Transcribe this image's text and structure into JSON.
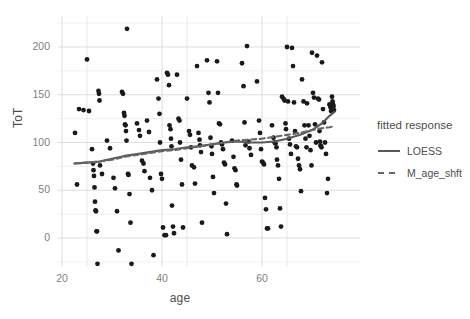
{
  "chart_data": {
    "type": "scatter",
    "title": "",
    "xlabel": "age",
    "ylabel": "ToT",
    "xlim": [
      21,
      76
    ],
    "ylim": [
      -30,
      228
    ],
    "xticks": [
      20,
      40,
      60
    ],
    "yticks": [
      0,
      50,
      100,
      150,
      200
    ],
    "xtick_labels": [
      "20",
      "40",
      "60"
    ],
    "ytick_labels": [
      "0",
      "50",
      "100",
      "150",
      "200"
    ],
    "grid": true,
    "legend_position": "right",
    "panel_background": "#ffffff",
    "grid_color": "#d9d9d9",
    "point_color": "#1a1a1a",
    "line_color": "#595959",
    "points": [
      [
        22.6,
        110
      ],
      [
        23.0,
        56
      ],
      [
        23.4,
        135
      ],
      [
        24.3,
        134
      ],
      [
        25.0,
        187
      ],
      [
        25.4,
        133
      ],
      [
        26.0,
        93
      ],
      [
        26.2,
        78
      ],
      [
        26.3,
        71
      ],
      [
        26.4,
        65
      ],
      [
        26.5,
        53
      ],
      [
        26.6,
        38
      ],
      [
        26.7,
        29
      ],
      [
        26.8,
        28
      ],
      [
        26.9,
        7
      ],
      [
        27.0,
        7
      ],
      [
        27.1,
        -27
      ],
      [
        27.3,
        154
      ],
      [
        27.4,
        151
      ],
      [
        27.5,
        144
      ],
      [
        27.6,
        76
      ],
      [
        28.0,
        67
      ],
      [
        29.0,
        102
      ],
      [
        29.6,
        94
      ],
      [
        30.3,
        63
      ],
      [
        30.6,
        52
      ],
      [
        31.0,
        28
      ],
      [
        31.3,
        -13
      ],
      [
        32.0,
        153
      ],
      [
        32.2,
        151
      ],
      [
        32.4,
        131
      ],
      [
        32.5,
        128
      ],
      [
        32.6,
        119
      ],
      [
        32.7,
        118
      ],
      [
        32.8,
        112
      ],
      [
        32.9,
        102
      ],
      [
        33.0,
        219
      ],
      [
        33.2,
        67
      ],
      [
        33.3,
        66
      ],
      [
        33.5,
        46
      ],
      [
        33.7,
        16
      ],
      [
        33.9,
        -27
      ],
      [
        35.0,
        120
      ],
      [
        35.4,
        113
      ],
      [
        35.6,
        107
      ],
      [
        36.0,
        81
      ],
      [
        36.3,
        78
      ],
      [
        36.5,
        70
      ],
      [
        37.0,
        123
      ],
      [
        37.4,
        111
      ],
      [
        37.6,
        63
      ],
      [
        38.0,
        50
      ],
      [
        38.3,
        -18
      ],
      [
        39.0,
        166
      ],
      [
        39.3,
        146
      ],
      [
        39.5,
        130
      ],
      [
        39.6,
        100
      ],
      [
        39.8,
        67
      ],
      [
        40.0,
        62
      ],
      [
        40.2,
        11
      ],
      [
        40.5,
        3
      ],
      [
        40.8,
        3
      ],
      [
        41.0,
        173
      ],
      [
        41.2,
        171
      ],
      [
        41.4,
        160
      ],
      [
        41.5,
        118
      ],
      [
        41.7,
        114
      ],
      [
        41.8,
        104
      ],
      [
        41.9,
        96
      ],
      [
        42.0,
        34
      ],
      [
        42.2,
        12
      ],
      [
        42.4,
        5
      ],
      [
        43.0,
        171
      ],
      [
        43.3,
        125
      ],
      [
        43.5,
        123
      ],
      [
        43.6,
        100
      ],
      [
        43.8,
        82
      ],
      [
        44.0,
        56
      ],
      [
        44.2,
        11
      ],
      [
        45.0,
        146
      ],
      [
        45.4,
        112
      ],
      [
        45.6,
        108
      ],
      [
        45.8,
        95
      ],
      [
        46.0,
        76
      ],
      [
        46.4,
        74
      ],
      [
        46.6,
        57
      ],
      [
        47.0,
        180
      ],
      [
        47.3,
        110
      ],
      [
        47.5,
        103
      ],
      [
        47.6,
        97
      ],
      [
        47.8,
        90
      ],
      [
        48.0,
        16
      ],
      [
        49.0,
        186
      ],
      [
        49.3,
        152
      ],
      [
        49.5,
        142
      ],
      [
        49.7,
        105
      ],
      [
        49.9,
        96
      ],
      [
        50.0,
        88
      ],
      [
        50.2,
        64
      ],
      [
        50.4,
        47
      ],
      [
        51.0,
        185
      ],
      [
        51.2,
        152
      ],
      [
        51.4,
        120
      ],
      [
        51.6,
        119
      ],
      [
        51.8,
        100
      ],
      [
        52.0,
        98
      ],
      [
        52.2,
        93
      ],
      [
        52.4,
        79
      ],
      [
        52.6,
        77
      ],
      [
        52.8,
        36
      ],
      [
        53.0,
        4
      ],
      [
        54.0,
        102
      ],
      [
        54.3,
        85
      ],
      [
        54.5,
        73
      ],
      [
        54.7,
        71
      ],
      [
        54.9,
        56
      ],
      [
        55.0,
        55
      ],
      [
        56.0,
        183
      ],
      [
        56.3,
        159
      ],
      [
        56.5,
        121
      ],
      [
        56.7,
        97
      ],
      [
        57.0,
        201
      ],
      [
        57.3,
        101
      ],
      [
        57.5,
        94
      ],
      [
        57.8,
        87
      ],
      [
        59.0,
        164
      ],
      [
        59.4,
        123
      ],
      [
        59.6,
        110
      ],
      [
        59.8,
        93
      ],
      [
        60.0,
        80
      ],
      [
        60.2,
        79
      ],
      [
        60.4,
        77
      ],
      [
        60.6,
        42
      ],
      [
        60.8,
        30
      ],
      [
        61.0,
        10
      ],
      [
        61.2,
        10
      ],
      [
        62.0,
        118
      ],
      [
        62.3,
        105
      ],
      [
        62.5,
        100
      ],
      [
        62.7,
        99
      ],
      [
        62.9,
        95
      ],
      [
        63.0,
        82
      ],
      [
        63.2,
        76
      ],
      [
        63.4,
        62
      ],
      [
        63.6,
        31
      ],
      [
        63.8,
        12
      ],
      [
        64.0,
        148
      ],
      [
        64.3,
        146
      ],
      [
        64.5,
        144
      ],
      [
        64.7,
        120
      ],
      [
        64.8,
        114
      ],
      [
        65.0,
        200
      ],
      [
        65.2,
        143
      ],
      [
        65.4,
        104
      ],
      [
        65.6,
        98
      ],
      [
        65.8,
        88
      ],
      [
        66.0,
        199
      ],
      [
        66.2,
        180
      ],
      [
        66.4,
        142
      ],
      [
        66.6,
        112
      ],
      [
        66.8,
        96
      ],
      [
        67.0,
        95
      ],
      [
        67.2,
        83
      ],
      [
        67.4,
        76
      ],
      [
        67.6,
        72
      ],
      [
        67.8,
        49
      ],
      [
        68.0,
        166
      ],
      [
        68.3,
        143
      ],
      [
        68.5,
        118
      ],
      [
        68.7,
        104
      ],
      [
        68.9,
        95
      ],
      [
        69.0,
        141
      ],
      [
        69.3,
        118
      ],
      [
        69.5,
        107
      ],
      [
        69.7,
        92
      ],
      [
        69.9,
        76
      ],
      [
        70.0,
        194
      ],
      [
        70.2,
        152
      ],
      [
        70.4,
        147
      ],
      [
        70.6,
        119
      ],
      [
        70.8,
        100
      ],
      [
        71.0,
        191
      ],
      [
        71.2,
        146
      ],
      [
        71.4,
        145
      ],
      [
        71.5,
        112
      ],
      [
        71.6,
        101
      ],
      [
        71.7,
        97
      ],
      [
        71.8,
        96
      ],
      [
        71.9,
        95
      ],
      [
        72.0,
        184
      ],
      [
        72.2,
        135
      ],
      [
        72.4,
        121
      ],
      [
        72.6,
        100
      ],
      [
        72.8,
        88
      ],
      [
        73.0,
        47
      ],
      [
        73.2,
        62
      ],
      [
        73.5,
        140
      ],
      [
        73.6,
        139
      ],
      [
        73.7,
        137
      ],
      [
        73.8,
        133
      ],
      [
        74.0,
        148
      ],
      [
        74.1,
        143
      ],
      [
        74.2,
        140
      ],
      [
        74.3,
        138
      ],
      [
        74.4,
        134
      ]
    ],
    "series": [
      {
        "name": "LOESS",
        "style": "solid",
        "color": "#595959",
        "points": [
          [
            22.5,
            78
          ],
          [
            25,
            79
          ],
          [
            27.5,
            80
          ],
          [
            30,
            83
          ],
          [
            32.5,
            86
          ],
          [
            35,
            88
          ],
          [
            37.5,
            90
          ],
          [
            40,
            92
          ],
          [
            42.5,
            93
          ],
          [
            45,
            95
          ],
          [
            47.5,
            96
          ],
          [
            50,
            98
          ],
          [
            52.5,
            100
          ],
          [
            55,
            101
          ],
          [
            57.5,
            100
          ],
          [
            60,
            100
          ],
          [
            62.5,
            101
          ],
          [
            65,
            104
          ],
          [
            67.5,
            108
          ],
          [
            70,
            113
          ],
          [
            72,
            120
          ],
          [
            73.5,
            128
          ],
          [
            74.5,
            132
          ]
        ]
      },
      {
        "name": "M_age_shft",
        "style": "dashed",
        "color": "#666666",
        "points": [
          [
            22.5,
            78
          ],
          [
            25,
            79
          ],
          [
            27.5,
            80
          ],
          [
            30,
            82
          ],
          [
            32.5,
            85
          ],
          [
            35,
            87
          ],
          [
            37.5,
            89
          ],
          [
            40,
            91
          ],
          [
            42.5,
            92
          ],
          [
            45,
            94
          ],
          [
            47.5,
            96
          ],
          [
            50,
            98
          ],
          [
            52.5,
            100
          ],
          [
            55,
            102
          ],
          [
            57.5,
            103
          ],
          [
            60,
            104
          ],
          [
            62.5,
            106
          ],
          [
            65,
            108
          ],
          [
            67.5,
            110
          ],
          [
            70,
            113
          ],
          [
            72,
            115
          ],
          [
            73.5,
            116
          ],
          [
            74.5,
            117
          ]
        ]
      }
    ]
  },
  "legend": {
    "title": "fitted response",
    "entries": [
      {
        "label": "LOESS",
        "style": "solid"
      },
      {
        "label": "M_age_shft",
        "style": "dashed"
      }
    ]
  },
  "axes": {
    "x_title": "age",
    "y_title": "ToT"
  }
}
